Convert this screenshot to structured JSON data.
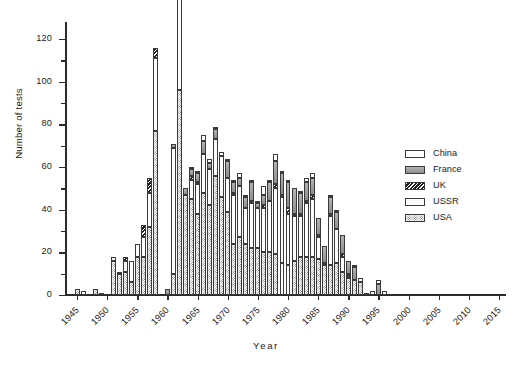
{
  "chart_data": {
    "type": "bar",
    "stacked": true,
    "title": "",
    "xlabel": "Year",
    "ylabel": "Number of tests",
    "xlim": [
      1943,
      2016
    ],
    "ylim": [
      0,
      128
    ],
    "ytick_values": [
      0,
      20,
      40,
      60,
      80,
      100,
      120
    ],
    "ytick_labels": [
      "0",
      "20",
      "40",
      "60",
      "80",
      "100",
      "120"
    ],
    "yminor_values": [
      10,
      30,
      50,
      70,
      90,
      110
    ],
    "xtick_values": [
      1945,
      1950,
      1955,
      1960,
      1965,
      1970,
      1975,
      1980,
      1985,
      1990,
      1995,
      2000,
      2005,
      2010,
      2015
    ],
    "xtick_labels": [
      "1945",
      "1950",
      "1955",
      "1960",
      "1965",
      "1970",
      "1975",
      "1980",
      "1985",
      "1990",
      "1995",
      "2000",
      "2005",
      "2010",
      "2015"
    ],
    "grid": false,
    "legend_position": "right",
    "legend": [
      "China",
      "France",
      "UK",
      "USSR",
      "USA"
    ],
    "series_styles": {
      "China": "open-white",
      "France": "solid-gray",
      "UK": "diagonal-hatch",
      "USSR": "open-outline",
      "USA": "dotted-stipple"
    },
    "categories": [
      1945,
      1946,
      1947,
      1948,
      1949,
      1950,
      1951,
      1952,
      1953,
      1954,
      1955,
      1956,
      1957,
      1958,
      1959,
      1960,
      1961,
      1962,
      1963,
      1964,
      1965,
      1966,
      1967,
      1968,
      1969,
      1970,
      1971,
      1972,
      1973,
      1974,
      1975,
      1976,
      1977,
      1978,
      1979,
      1980,
      1981,
      1982,
      1983,
      1984,
      1985,
      1986,
      1987,
      1988,
      1989,
      1990,
      1991,
      1992,
      1993,
      1994,
      1995,
      1996,
      1997,
      1998,
      1999,
      2000,
      2005,
      2006,
      2009,
      2010,
      2013,
      2016
    ],
    "series": [
      {
        "name": "USA",
        "values": [
          3,
          2,
          0,
          3,
          0,
          0,
          16,
          10,
          11,
          6,
          18,
          18,
          32,
          77,
          0,
          0,
          10,
          96,
          47,
          45,
          38,
          48,
          42,
          56,
          46,
          39,
          24,
          27,
          24,
          22,
          22,
          20,
          20,
          19,
          15,
          14,
          16,
          18,
          18,
          18,
          17,
          14,
          14,
          15,
          11,
          8,
          7,
          6,
          0,
          0,
          0,
          0,
          0,
          0,
          0,
          0,
          0,
          0,
          0,
          0,
          0,
          0
        ]
      },
      {
        "name": "USSR",
        "values": [
          0,
          0,
          0,
          0,
          1,
          0,
          2,
          0,
          5,
          10,
          6,
          9,
          16,
          34,
          0,
          0,
          59,
          79,
          0,
          9,
          14,
          18,
          17,
          17,
          19,
          16,
          23,
          24,
          17,
          21,
          19,
          21,
          24,
          31,
          31,
          24,
          21,
          19,
          25,
          27,
          10,
          0,
          23,
          16,
          7,
          1,
          0,
          0,
          0,
          0,
          0,
          0,
          0,
          0,
          0,
          0,
          0,
          0,
          0,
          0,
          0,
          0
        ]
      },
      {
        "name": "UK",
        "values": [
          0,
          0,
          0,
          0,
          0,
          0,
          0,
          1,
          2,
          0,
          0,
          6,
          7,
          5,
          0,
          0,
          0,
          2,
          0,
          2,
          1,
          0,
          0,
          0,
          0,
          0,
          1,
          0,
          0,
          1,
          0,
          1,
          0,
          2,
          1,
          3,
          1,
          1,
          1,
          2,
          1,
          1,
          1,
          0,
          1,
          1,
          0,
          0,
          0,
          0,
          0,
          0,
          0,
          0,
          0,
          0,
          0,
          0,
          0,
          0,
          0,
          0
        ]
      },
      {
        "name": "France",
        "values": [
          0,
          0,
          0,
          0,
          0,
          0,
          0,
          0,
          0,
          0,
          0,
          0,
          0,
          0,
          0,
          3,
          2,
          1,
          3,
          3,
          4,
          6,
          3,
          5,
          0,
          8,
          5,
          4,
          5,
          9,
          2,
          5,
          9,
          11,
          10,
          12,
          12,
          10,
          9,
          8,
          8,
          8,
          8,
          8,
          9,
          6,
          6,
          0,
          0,
          0,
          5,
          0,
          0,
          0,
          0,
          0,
          0,
          0,
          0,
          0,
          0,
          0
        ]
      },
      {
        "name": "China",
        "values": [
          0,
          0,
          0,
          0,
          0,
          0,
          0,
          0,
          0,
          0,
          0,
          0,
          0,
          0,
          0,
          0,
          0,
          0,
          0,
          1,
          1,
          3,
          2,
          1,
          2,
          1,
          1,
          2,
          1,
          1,
          1,
          4,
          1,
          3,
          1,
          1,
          0,
          1,
          2,
          2,
          0,
          0,
          1,
          1,
          0,
          0,
          1,
          2,
          1,
          2,
          2,
          2,
          0,
          0,
          0,
          0,
          0,
          0,
          0,
          0,
          0,
          0
        ]
      }
    ]
  }
}
